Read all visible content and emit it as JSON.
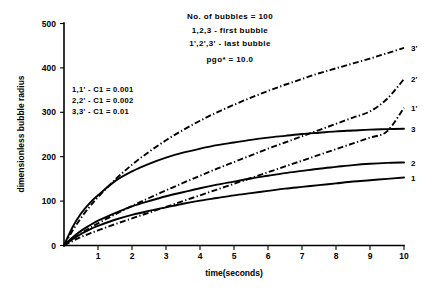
{
  "chart_data": {
    "type": "line",
    "title": "",
    "xlabel": "time(seconds)",
    "ylabel": "dimensionless bubble radius",
    "xlim": [
      0,
      10
    ],
    "ylim": [
      0,
      500
    ],
    "grid": false,
    "legend_position": "inline-right-labels",
    "xticks": [
      "1",
      "2",
      "3",
      "4",
      "5",
      "6",
      "7",
      "8",
      "9",
      "10"
    ],
    "xtick_values": [
      1,
      2,
      3,
      4,
      5,
      6,
      7,
      8,
      9,
      10
    ],
    "yticks": [
      "0",
      "100",
      "200",
      "300",
      "400",
      "500"
    ],
    "ytick_values": [
      0,
      100,
      200,
      300,
      400,
      500
    ],
    "x": [
      0,
      0.25,
      0.5,
      0.75,
      1,
      1.5,
      2,
      2.5,
      3,
      3.5,
      4,
      4.5,
      5,
      5.5,
      6,
      6.5,
      7,
      7.5,
      8,
      8.5,
      9,
      9.5,
      10
    ],
    "series": [
      {
        "name": "1",
        "label": "1",
        "style": "solid",
        "description": "C1 = 0.001, first bubble",
        "values": [
          0,
          14,
          26,
          36,
          44,
          58,
          69,
          78,
          86,
          94,
          101,
          107,
          113,
          118,
          123,
          128,
          132,
          136,
          140,
          144,
          147,
          150,
          153
        ]
      },
      {
        "name": "2",
        "label": "2",
        "style": "solid",
        "description": "C1 = 0.002, first bubble",
        "values": [
          0,
          18,
          33,
          45,
          56,
          73,
          88,
          100,
          111,
          120,
          129,
          137,
          144,
          151,
          157,
          163,
          168,
          173,
          177,
          181,
          184,
          186,
          187
        ]
      },
      {
        "name": "3",
        "label": "3",
        "style": "solid",
        "description": "C1 = 0.01, first bubble",
        "values": [
          0,
          41,
          72,
          95,
          113,
          145,
          167,
          184,
          198,
          209,
          218,
          226,
          232,
          238,
          243,
          247,
          251,
          254,
          257,
          259,
          261,
          262,
          263
        ]
      },
      {
        "name": "1'",
        "label": "1'",
        "style": "dash-dot",
        "description": "C1 = 0.001, last bubble",
        "values": [
          0,
          10,
          19,
          27,
          34,
          48,
          61,
          74,
          87,
          100,
          113,
          126,
          139,
          152,
          165,
          178,
          191,
          204,
          217,
          230,
          243,
          257,
          310
        ]
      },
      {
        "name": "2'",
        "label": "2'",
        "style": "dash-dot",
        "description": "C1 = 0.002, last bubble",
        "values": [
          0,
          14,
          27,
          39,
          50,
          70,
          89,
          107,
          124,
          141,
          157,
          173,
          188,
          203,
          218,
          232,
          246,
          260,
          274,
          288,
          302,
          330,
          375
        ]
      },
      {
        "name": "3'",
        "label": "3'",
        "style": "dash-dot",
        "description": "C1 = 0.01, last bubble",
        "values": [
          0,
          33,
          62,
          87,
          109,
          148,
          182,
          211,
          237,
          260,
          281,
          300,
          317,
          333,
          348,
          362,
          375,
          388,
          399,
          410,
          421,
          433,
          445
        ]
      }
    ],
    "annotations": [
      "No. of bubbles  =  100",
      "1,2,3 - first bubble",
      "1',2',3' - last bubble",
      "pgo*  =  10.0"
    ],
    "legend_entries": [
      "1,1'  -  C1 = 0.001",
      "2,2'  -  C1 = 0.002",
      "3,3'  -  C1 = 0.01"
    ],
    "curve_end_labels": [
      "3'",
      "2'",
      "1'",
      "3",
      "2",
      "1"
    ]
  }
}
